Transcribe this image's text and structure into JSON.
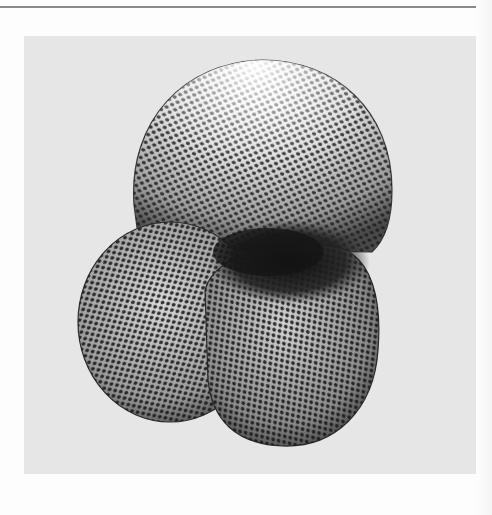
{
  "figure": {
    "style": "grayscale scanned photograph",
    "colors": {
      "page_background": "#fdfdfd",
      "top_rule": "#8a8a8a",
      "panel_background": "#e6e6e6",
      "shell_light": "#f2f2f2",
      "shell_mid": "#9a9a9a",
      "shell_dark": "#2a2a2a",
      "pore": "#1e1e1e"
    },
    "chambers": [
      {
        "name": "upper-chamber",
        "cx": 258,
        "cy": 150,
        "r": 128
      },
      {
        "name": "left-chamber",
        "cx": 170,
        "cy": 322,
        "r": 100
      },
      {
        "name": "right-chamber",
        "cx": 292,
        "cy": 350,
        "r": 100
      },
      {
        "name": "aperture-shadow",
        "cx": 290,
        "cy": 262
      }
    ]
  }
}
